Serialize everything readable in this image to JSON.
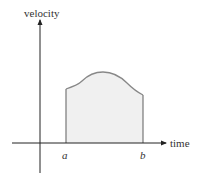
{
  "diagram": {
    "y_axis_label": "velocity",
    "x_axis_label": "time",
    "left_bound_label": "a",
    "right_bound_label": "b",
    "region_fill_color": "#f0f0f0",
    "curve_color": "#888888",
    "axis_color": "#222222"
  }
}
